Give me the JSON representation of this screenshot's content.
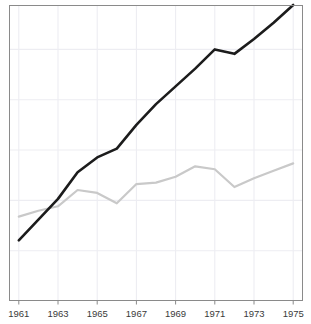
{
  "chart_data": {
    "type": "line",
    "title": "",
    "subtitle": "",
    "xlabel": "",
    "ylabel": "",
    "grid": true,
    "legend": "none",
    "x": [
      1961,
      1962,
      1963,
      1964,
      1965,
      1966,
      1967,
      1968,
      1969,
      1970,
      1971,
      1972,
      1973,
      1974,
      1975
    ],
    "xlim": [
      1960.5,
      1975.5
    ],
    "ylim": [
      0,
      100
    ],
    "xticks": [
      1961,
      1963,
      1965,
      1967,
      1969,
      1971,
      1973,
      1975
    ],
    "xtick_labels": [
      "1961",
      "1963",
      "1965",
      "1967",
      "1969",
      "1971",
      "1973",
      "1975"
    ],
    "yticks": [
      0,
      17,
      34,
      51,
      68,
      85,
      100
    ],
    "ytick_labels": [
      "",
      "",
      "",
      "",
      "",
      "",
      ""
    ],
    "series": [
      {
        "name": "dark-series",
        "color": "#1c1c1c",
        "width": 2.6,
        "values": [
          20.5,
          27.5,
          34.5,
          43.5,
          48.5,
          51.5,
          59.5,
          66.5,
          72.5,
          78.5,
          85.0,
          83.5,
          88.5,
          94.0,
          100.0
        ]
      },
      {
        "name": "light-series",
        "color": "#c9c9c9",
        "width": 2.2,
        "values": [
          28.5,
          30.5,
          32.0,
          37.5,
          36.5,
          33.0,
          39.5,
          40.0,
          42.0,
          45.5,
          44.5,
          38.5,
          41.5,
          44.0,
          46.5
        ]
      }
    ],
    "colors": {
      "dark_line": "#1c1c1c",
      "light_line": "#c9c9c9",
      "gridline": "#ededf2",
      "frame": "#8a8a8a",
      "tick_text": "#3a3a3a",
      "background": "#ffffff"
    },
    "axes_geometry": {
      "plot_left": 9,
      "plot_right": 303,
      "plot_top": 5,
      "plot_bottom": 301
    }
  }
}
